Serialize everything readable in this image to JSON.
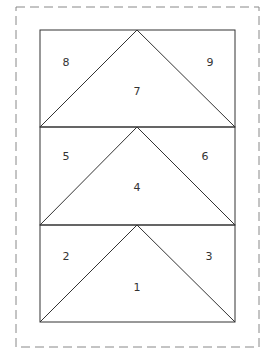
{
  "diagram": {
    "colors": {
      "line": "#333333",
      "dashed": "#888888",
      "background": "#ffffff"
    },
    "rows": [
      {
        "center": "7",
        "left": "8",
        "right": "9"
      },
      {
        "center": "4",
        "left": "5",
        "right": "6"
      },
      {
        "center": "1",
        "left": "2",
        "right": "3"
      }
    ]
  }
}
